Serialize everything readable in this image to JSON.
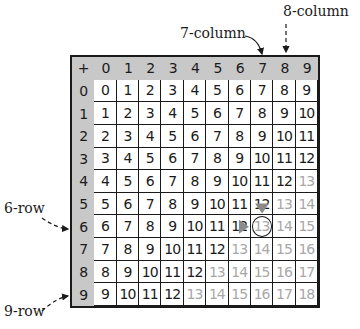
{
  "operator_symbol": "+",
  "column_headers": [
    "0",
    "1",
    "2",
    "3",
    "4",
    "5",
    "6",
    "7",
    "8",
    "9"
  ],
  "row_headers": [
    "0",
    "1",
    "2",
    "3",
    "4",
    "5",
    "6",
    "7",
    "8",
    "9"
  ],
  "cells": [
    [
      "0",
      "1",
      "2",
      "3",
      "4",
      "5",
      "6",
      "7",
      "8",
      "9"
    ],
    [
      "1",
      "2",
      "3",
      "4",
      "5",
      "6",
      "7",
      "8",
      "9",
      "10"
    ],
    [
      "2",
      "3",
      "4",
      "5",
      "6",
      "7",
      "8",
      "9",
      "10",
      "11"
    ],
    [
      "3",
      "4",
      "5",
      "6",
      "7",
      "8",
      "9",
      "10",
      "11",
      "12"
    ],
    [
      "4",
      "5",
      "6",
      "7",
      "8",
      "9",
      "10",
      "11",
      "12",
      "13"
    ],
    [
      "5",
      "6",
      "7",
      "8",
      "9",
      "10",
      "11",
      "12",
      "13",
      "14"
    ],
    [
      "6",
      "7",
      "8",
      "9",
      "10",
      "11",
      "12",
      "13",
      "14",
      "15"
    ],
    [
      "7",
      "8",
      "9",
      "10",
      "11",
      "12",
      "13",
      "14",
      "15",
      "16"
    ],
    [
      "8",
      "9",
      "10",
      "11",
      "12",
      "13",
      "14",
      "15",
      "16",
      "17"
    ],
    [
      "9",
      "10",
      "11",
      "12",
      "13",
      "14",
      "15",
      "16",
      "17",
      "18"
    ]
  ],
  "faded_threshold": 13,
  "annotations": {
    "col7_label": "7-column",
    "col8_label": "8-column",
    "row6_label": "6-row",
    "row9_label": "9-row"
  },
  "highlight": {
    "column_index": 7,
    "column_rows_from": 0,
    "column_rows_to": 5,
    "row_index": 6,
    "row_cols_from": 0,
    "row_cols_to": 6,
    "circled_row": 6,
    "circled_col": 7,
    "circled_value": "13"
  },
  "colors": {
    "header_bg": "#c8c8c8",
    "highlight": "#8a8a8a",
    "text": "#1a1a1a",
    "faded_text": "#a8a8a8"
  }
}
